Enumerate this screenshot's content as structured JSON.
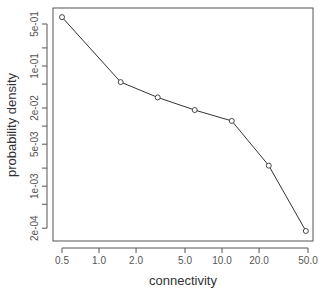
{
  "chart_data": {
    "type": "line",
    "title": "",
    "xlabel": "connectivity",
    "ylabel": "probability density",
    "x_scale": "log",
    "y_scale": "log",
    "x_tick_labels": [
      "0.5",
      "1.0",
      "2.0",
      "5.0",
      "10.0",
      "20.0",
      "50.0"
    ],
    "x_tick_values": [
      0.5,
      1,
      2,
      5,
      10,
      20,
      50
    ],
    "y_tick_labels": [
      "5e-01",
      "1e-01",
      "2e-02",
      "5e-03",
      "1e-03",
      "2e-04"
    ],
    "y_tick_values": [
      0.5,
      0.1,
      0.02,
      0.005,
      0.001,
      0.0002
    ],
    "y_minor_tick_values": [
      0.2,
      0.05,
      0.01,
      0.002,
      0.0005
    ],
    "xlim": [
      0.45,
      55
    ],
    "ylim": [
      0.00015,
      0.9
    ],
    "grid": false,
    "legend": null,
    "markers": "open-circle",
    "series": [
      {
        "name": "degree distribution",
        "x": [
          0.5,
          1.5,
          3,
          6,
          12,
          24,
          48
        ],
        "values": [
          0.65,
          0.054,
          0.03,
          0.0185,
          0.0122,
          0.0022,
          0.00018
        ]
      }
    ]
  }
}
